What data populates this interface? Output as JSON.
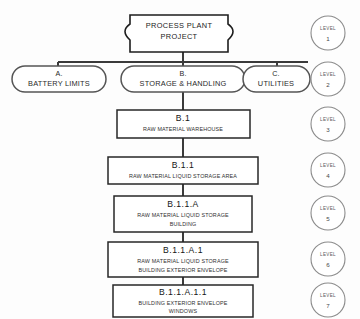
{
  "diagram": {
    "type": "work-breakdown-structure",
    "background_color": "#fdfdfd",
    "line_color": "#3a3a3a",
    "text_color": "#2a2a2a"
  },
  "root": {
    "shape": "banner",
    "line1": "PROCESS PLANT",
    "line2": "PROJECT",
    "level": 1
  },
  "level2": {
    "shape": "stadium",
    "nodes": [
      {
        "code": "A.",
        "name": "BATTERY LIMITS"
      },
      {
        "code": "B.",
        "name": "STORAGE & HANDLING"
      },
      {
        "code": "C.",
        "name": "UTILITIES"
      }
    ]
  },
  "chain": [
    {
      "level": 3,
      "code": "B.1",
      "desc_lines": [
        "RAW MATERIAL WAREHOUSE"
      ]
    },
    {
      "level": 4,
      "code": "B.1.1",
      "desc_lines": [
        "RAW MATERIAL  LIQUID STORAGE AREA"
      ]
    },
    {
      "level": 5,
      "code": "B.1.1.A",
      "desc_lines": [
        "RAW MATERIAL  LIQUID STORAGE",
        "BUILDING"
      ]
    },
    {
      "level": 6,
      "code": "B.1.1.A.1",
      "desc_lines": [
        "RAW MATERIAL LIQUID STORAGE",
        "BUILDING EXTERIOR ENVELOPE"
      ]
    },
    {
      "level": 7,
      "code": "B.1.1.A.1.1",
      "desc_lines": [
        "BUILDING EXTERIOR ENVELOPE",
        "WINDOWS"
      ]
    }
  ],
  "levels": {
    "label": "LEVEL",
    "markers": [
      {
        "label": "LEVEL",
        "number": "1"
      },
      {
        "label": "LEVEL",
        "number": "2"
      },
      {
        "label": "LEVEL",
        "number": "3"
      },
      {
        "label": "LEVEL",
        "number": "4"
      },
      {
        "label": "LEVEL",
        "number": "5"
      },
      {
        "label": "LEVEL",
        "number": "6"
      },
      {
        "label": "LEVEL",
        "number": "7"
      }
    ]
  }
}
